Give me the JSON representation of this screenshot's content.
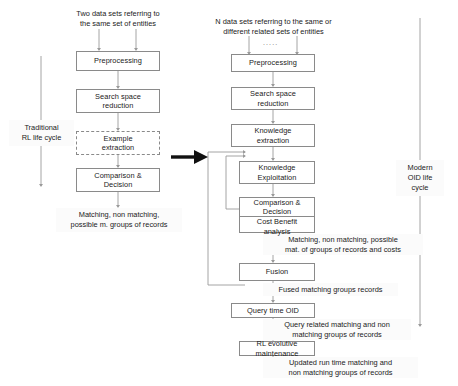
{
  "figure": {
    "title_left": "Two data sets referring to the  same set of entities",
    "title_right": "N  data sets referring to the same or different related sets of entities",
    "ellipsis": "....."
  },
  "left_column": {
    "header": "Two data sets referring to\nthe  same set of entities",
    "header_line1": "Two data sets referring to",
    "header_line2": "the  same set of entities",
    "nodes": [
      {
        "id": "preprocessing",
        "label": "Preprocessing",
        "style": "solid"
      },
      {
        "id": "search-space-reduction",
        "label": "Search space\nreduction",
        "line1": "Search space",
        "line2": "reduction",
        "style": "solid"
      },
      {
        "id": "example-extraction",
        "label": "Example\nextraction",
        "line1": "Example",
        "line2": "extraction",
        "style": "dashed"
      },
      {
        "id": "comparison-decision",
        "label": "Comparison &\nDecision",
        "line1": "Comparison &",
        "line2": "Decision",
        "style": "solid"
      }
    ],
    "output": {
      "line1": "Matching, non matching,",
      "line2": "possible m. groups of records"
    },
    "lifecycle": {
      "line1": "Traditional",
      "line2": "RL life  cycle"
    }
  },
  "right_column": {
    "header_line1": "N  data sets referring to the same or",
    "header_line2": "different related sets of entities",
    "nodes": [
      {
        "id": "preprocessing",
        "label": "Preprocessing"
      },
      {
        "id": "search-space-reduction",
        "line1": "Search space",
        "line2": "reduction"
      },
      {
        "id": "knowledge-extraction",
        "line1": "Knowledge",
        "line2": "extraction"
      },
      {
        "id": "knowledge-exploitation",
        "line1": "Knowledge",
        "line2": "Exploitation"
      },
      {
        "id": "comparison-decision-cost",
        "line1": "Comparison &",
        "line2": "Decision",
        "line3": "Cost Benefit",
        "line4": "analysis"
      },
      {
        "id": "fusion",
        "label": "Fusion"
      },
      {
        "id": "query-time-oid",
        "label": "Query time OID"
      },
      {
        "id": "rl-evolutive-maintenance",
        "line1": "RL evolutive",
        "line2": "maintenance"
      }
    ],
    "annotations": [
      {
        "id": "matching-costs",
        "line1": "Matching, non matching, possible",
        "line2": "mat. of groups of records and costs"
      },
      {
        "id": "fused-groups",
        "line1": "Fused matching groups records"
      },
      {
        "id": "query-related",
        "line1": "Query related matching and non",
        "line2": "matching  groups of records"
      },
      {
        "id": "updated-runtime",
        "line1": "Updated run time matching and",
        "line2": "non matching  groups of records"
      }
    ],
    "lifecycle": {
      "line1": "Modern",
      "line2": "OID life",
      "line3": "cycle"
    }
  },
  "colors": {
    "box_stroke": "#8a8a8a",
    "wire": "#9a9a9a",
    "text": "#1a1a1a",
    "big_arrow": "#111111",
    "annot_bg": "#fbfbfb"
  }
}
